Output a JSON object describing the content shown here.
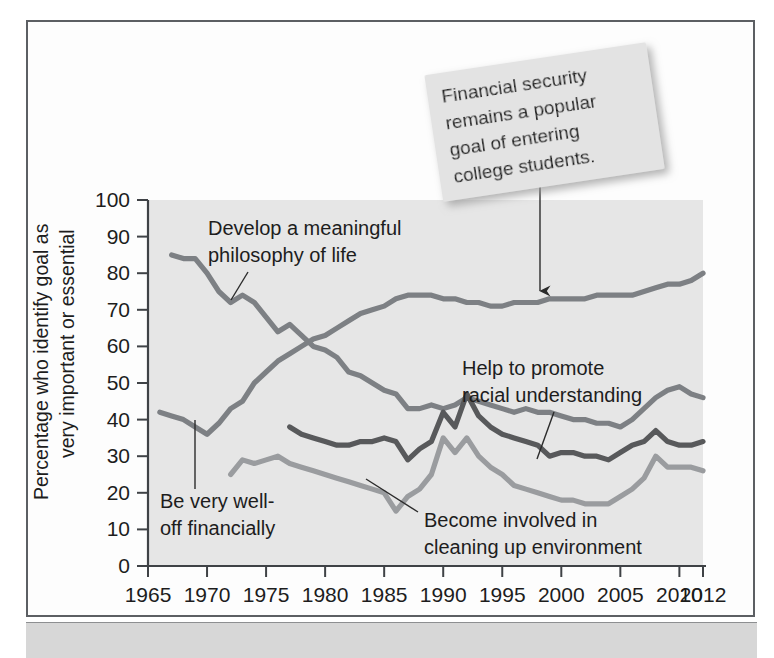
{
  "figure": {
    "frame_border_color": "#5c5f63",
    "plot_background_color": "#e6e6e6",
    "page_background_color": "#ffffff",
    "bottom_bar_color": "#d7d7d7"
  },
  "callout": {
    "lines": [
      "Financial security",
      "remains a popular",
      "goal of entering",
      "college students."
    ],
    "background_color": "#e3e3e3",
    "pointer": "arrow-down"
  },
  "chart_data": {
    "type": "line",
    "title": "",
    "subtitle": "",
    "xlabel": "",
    "ylabel": "Percentage who identify goal as very important or essential",
    "ylabel_lines": [
      "Percentage who identify goal as",
      "very important or essential"
    ],
    "xlim": [
      1965,
      2012
    ],
    "ylim": [
      0,
      100
    ],
    "grid": false,
    "legend_position": "inline-annotations",
    "xticks": [
      1965,
      1970,
      1975,
      1980,
      1985,
      1990,
      1995,
      2000,
      2005,
      2010,
      2012
    ],
    "xtick_labels": [
      "1965",
      "1970",
      "1975",
      "1980",
      "1985",
      "1990",
      "1995",
      "2000",
      "2005",
      "2010",
      "2012"
    ],
    "yticks": [
      0,
      10,
      20,
      30,
      40,
      50,
      60,
      70,
      80,
      90,
      100
    ],
    "ytick_labels": [
      "0",
      "10",
      "20",
      "30",
      "40",
      "50",
      "60",
      "70",
      "80",
      "90",
      "100"
    ],
    "series": [
      {
        "name": "Be very well-off financially",
        "color": "#7d8084",
        "label_lines": [
          "Be very well-",
          "off financially"
        ],
        "x": [
          1966,
          1967,
          1968,
          1969,
          1970,
          1971,
          1972,
          1973,
          1974,
          1975,
          1976,
          1977,
          1978,
          1979,
          1980,
          1981,
          1982,
          1983,
          1984,
          1985,
          1986,
          1987,
          1988,
          1989,
          1990,
          1991,
          1992,
          1993,
          1994,
          1995,
          1996,
          1997,
          1998,
          1999,
          2000,
          2001,
          2002,
          2003,
          2004,
          2005,
          2006,
          2007,
          2008,
          2009,
          2010,
          2011,
          2012
        ],
        "values": [
          42,
          41,
          40,
          38,
          36,
          39,
          43,
          45,
          50,
          53,
          56,
          58,
          60,
          62,
          63,
          65,
          67,
          69,
          70,
          71,
          73,
          74,
          74,
          74,
          73,
          73,
          72,
          72,
          71,
          71,
          72,
          72,
          72,
          73,
          73,
          73,
          73,
          74,
          74,
          74,
          74,
          75,
          76,
          77,
          77,
          78,
          80
        ]
      },
      {
        "name": "Develop a meaningful philosophy of life",
        "color": "#7d8084",
        "label_lines": [
          "Develop a meaningful",
          "philosophy of life"
        ],
        "x": [
          1967,
          1968,
          1969,
          1970,
          1971,
          1972,
          1973,
          1974,
          1975,
          1976,
          1977,
          1978,
          1979,
          1980,
          1981,
          1982,
          1983,
          1984,
          1985,
          1986,
          1987,
          1988,
          1989,
          1990,
          1991,
          1992,
          1993,
          1994,
          1995,
          1996,
          1997,
          1998,
          1999,
          2000,
          2001,
          2002,
          2003,
          2004,
          2005,
          2006,
          2007,
          2008,
          2009,
          2010,
          2011,
          2012
        ],
        "values": [
          85,
          84,
          84,
          80,
          75,
          72,
          74,
          72,
          68,
          64,
          66,
          63,
          60,
          59,
          57,
          53,
          52,
          50,
          48,
          47,
          43,
          43,
          44,
          43,
          44,
          46,
          45,
          44,
          43,
          42,
          43,
          42,
          42,
          41,
          40,
          40,
          39,
          39,
          38,
          40,
          43,
          46,
          48,
          49,
          47,
          46
        ]
      },
      {
        "name": "Help to promote racial understanding",
        "color": "#58595b",
        "label_lines": [
          "Help to promote",
          "racial understanding"
        ],
        "x": [
          1977,
          1978,
          1979,
          1980,
          1981,
          1982,
          1983,
          1984,
          1985,
          1986,
          1987,
          1988,
          1989,
          1990,
          1991,
          1992,
          1993,
          1994,
          1995,
          1996,
          1997,
          1998,
          1999,
          2000,
          2001,
          2002,
          2003,
          2004,
          2005,
          2006,
          2007,
          2008,
          2009,
          2010,
          2011,
          2012
        ],
        "values": [
          38,
          36,
          35,
          34,
          33,
          33,
          34,
          34,
          35,
          34,
          29,
          32,
          34,
          42,
          38,
          47,
          41,
          38,
          36,
          35,
          34,
          33,
          30,
          31,
          31,
          30,
          30,
          29,
          31,
          33,
          34,
          37,
          34,
          33,
          33,
          34
        ]
      },
      {
        "name": "Become involved in cleaning up environment",
        "color": "#9a9c9f",
        "label_lines": [
          "Become involved in",
          "cleaning up environment"
        ],
        "x": [
          1972,
          1973,
          1974,
          1975,
          1976,
          1977,
          1978,
          1979,
          1980,
          1981,
          1982,
          1983,
          1984,
          1985,
          1986,
          1987,
          1988,
          1989,
          1990,
          1991,
          1992,
          1993,
          1994,
          1995,
          1996,
          1997,
          1998,
          1999,
          2000,
          2001,
          2002,
          2003,
          2004,
          2005,
          2006,
          2007,
          2008,
          2009,
          2010,
          2011,
          2012
        ],
        "values": [
          25,
          29,
          28,
          29,
          30,
          28,
          27,
          26,
          25,
          24,
          23,
          22,
          21,
          20,
          15,
          19,
          21,
          25,
          35,
          31,
          35,
          30,
          27,
          25,
          22,
          21,
          20,
          19,
          18,
          18,
          17,
          17,
          17,
          19,
          21,
          24,
          30,
          27,
          27,
          27,
          26
        ]
      }
    ]
  }
}
